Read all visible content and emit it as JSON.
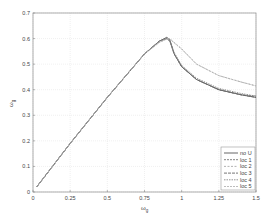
{
  "chart_data": {
    "type": "line",
    "title": "",
    "xlabel": "ω/ω_g",
    "ylabel": "ω/ω_g",
    "xlim": [
      0,
      1.5
    ],
    "ylim": [
      0,
      0.7
    ],
    "xticks": [
      "0",
      "0.25",
      "0.5",
      "0.75",
      "1",
      "1.25",
      "1.5"
    ],
    "yticks": [
      "0",
      "0.1",
      "0.2",
      "0.3",
      "0.4",
      "0.5",
      "0.6",
      "0.7"
    ],
    "grid": true,
    "legend_position": "lower right",
    "x": [
      0.025,
      0.25,
      0.5,
      0.75,
      0.85,
      0.9,
      0.92,
      0.95,
      1.0,
      1.1,
      1.25,
      1.4,
      1.5
    ],
    "series": [
      {
        "name": "no U",
        "style": "solid",
        "values": [
          0.02,
          0.19,
          0.37,
          0.54,
          0.59,
          0.605,
          0.595,
          0.54,
          0.49,
          0.44,
          0.4,
          0.38,
          0.37
        ]
      },
      {
        "name": "loc 1",
        "style": "dashed",
        "values": [
          0.02,
          0.19,
          0.37,
          0.54,
          0.59,
          0.6,
          0.59,
          0.54,
          0.49,
          0.44,
          0.4,
          0.38,
          0.375
        ]
      },
      {
        "name": "loc 2",
        "style": "dashed",
        "values": [
          0.02,
          0.19,
          0.37,
          0.54,
          0.585,
          0.6,
          0.6,
          0.585,
          0.56,
          0.5,
          0.455,
          0.43,
          0.415
        ]
      },
      {
        "name": "loc 3",
        "style": "dashed",
        "values": [
          0.02,
          0.19,
          0.37,
          0.54,
          0.59,
          0.6,
          0.59,
          0.54,
          0.49,
          0.44,
          0.4,
          0.38,
          0.37
        ]
      },
      {
        "name": "loc 4",
        "style": "dashed",
        "values": [
          0.02,
          0.19,
          0.37,
          0.54,
          0.59,
          0.6,
          0.592,
          0.545,
          0.495,
          0.445,
          0.405,
          0.385,
          0.375
        ]
      },
      {
        "name": "loc 5",
        "style": "dashed",
        "values": [
          0.02,
          0.19,
          0.37,
          0.54,
          0.585,
          0.598,
          0.598,
          0.583,
          0.558,
          0.5,
          0.455,
          0.43,
          0.415
        ]
      }
    ]
  },
  "legend": {
    "items": [
      "no U",
      "loc 1",
      "loc 2",
      "loc 3",
      "loc 4",
      "loc 5"
    ]
  },
  "axes": {
    "xlabel_main": "ω",
    "xlabel_sub": "g",
    "ylabel_main": "ω",
    "ylabel_sub": "g"
  }
}
